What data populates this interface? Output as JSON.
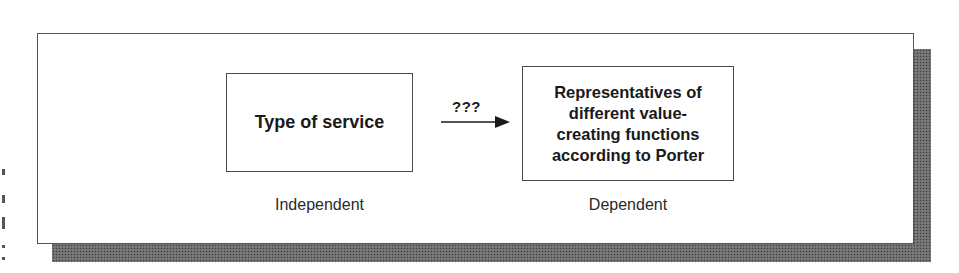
{
  "diagram": {
    "type": "variable-relationship",
    "independent": {
      "box_text": "Type of service",
      "caption": "Independent"
    },
    "relation": {
      "label": "???",
      "direction": "left-to-right"
    },
    "dependent": {
      "box_lines": [
        "Representatives of",
        "different value-",
        "creating functions",
        "according to Porter"
      ],
      "caption": "Dependent"
    }
  },
  "colors": {
    "border": "#4a4a4a",
    "shadow": "#6e6e6e",
    "text": "#1a1a1a",
    "background": "#ffffff"
  }
}
